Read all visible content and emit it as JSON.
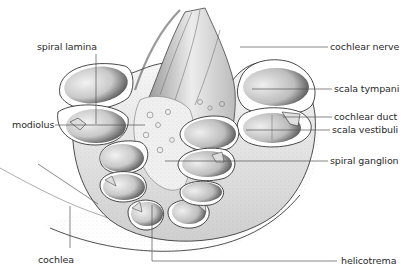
{
  "figure": {
    "style": "stippled pen-and-ink anatomical illustration",
    "colors": {
      "background": "#ffffff",
      "ink": "#2a2a2a",
      "leader_line": "#555555",
      "shade_dark": "#4a4a4a",
      "shade_light": "#e6e6e6"
    }
  },
  "labels": {
    "spiral_lamina": "spiral lamina",
    "modiolus": "modiolus",
    "cochlea": "cochlea",
    "cochlear_nerve": "cochlear nerve",
    "scala_tympani": "scala tympani",
    "cochlear_duct": "cochlear duct",
    "scala_vestibuli": "scala vestibuli",
    "spiral_ganglion": "spiral ganglion",
    "helicotrema": "helicotrema"
  }
}
